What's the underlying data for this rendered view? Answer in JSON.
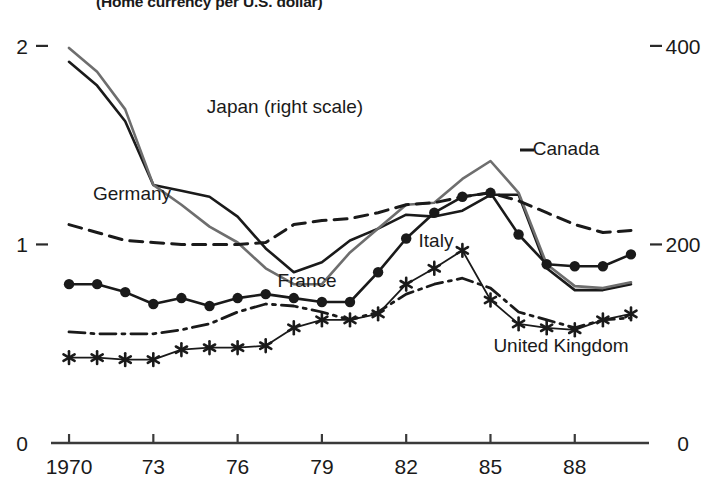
{
  "chart_data": {
    "type": "line",
    "title": "(Home currency per U.S. dollar)",
    "xlabel": "",
    "ylabel": "",
    "grid": false,
    "legend_position": "inline-annotations",
    "x": [
      1970,
      1971,
      1972,
      1973,
      1974,
      1975,
      1976,
      1977,
      1978,
      1979,
      1980,
      1981,
      1982,
      1983,
      1984,
      1985,
      1986,
      1987,
      1988,
      1989,
      1990
    ],
    "x_tick_labels": [
      "1970",
      "73",
      "76",
      "79",
      "82",
      "85",
      "88"
    ],
    "x_tick_values": [
      1970,
      1973,
      1976,
      1979,
      1982,
      1985,
      1988
    ],
    "xlim": [
      1969.5,
      1990.5
    ],
    "left_axis": {
      "label_low": "0",
      "label_mid": "1",
      "label_high": "2",
      "ticks": [
        0,
        1,
        2
      ],
      "ylim": [
        0,
        2.08
      ]
    },
    "right_axis": {
      "label_low": "0",
      "label_mid": "200",
      "label_high": "400",
      "ticks": [
        0,
        200,
        400
      ],
      "ylim": [
        0,
        416
      ],
      "note": "Japan uses right scale"
    },
    "series": [
      {
        "name": "Japan (right scale)",
        "label": "Japan (right scale)",
        "axis": "right",
        "style": "solid",
        "marker": "none",
        "color": "#1a1a1a",
        "width": 2.6,
        "values": [
          1.92,
          1.8,
          1.62,
          1.3,
          1.27,
          1.24,
          1.14,
          0.98,
          0.86,
          0.91,
          1.02,
          1.08,
          1.15,
          1.14,
          1.17,
          1.25,
          1.25,
          0.88,
          0.77,
          0.77,
          0.8
        ],
        "label_xy": [
          285,
          113
        ]
      },
      {
        "name": "Germany",
        "label": "Germany",
        "axis": "left",
        "style": "solid",
        "marker": "none",
        "color": "#6e6e6e",
        "width": 2.6,
        "values": [
          1.99,
          1.87,
          1.68,
          1.3,
          1.2,
          1.09,
          1.01,
          0.88,
          0.8,
          0.8,
          0.96,
          1.08,
          1.2,
          1.21,
          1.33,
          1.42,
          1.26,
          0.9,
          0.79,
          0.78,
          0.81
        ],
        "label_xy": [
          132,
          200
        ]
      },
      {
        "name": "Canada",
        "label": "Canada",
        "axis": "left",
        "style": "dashed",
        "marker": "none",
        "color": "#1a1a1a",
        "width": 3.0,
        "values": [
          1.1,
          1.06,
          1.02,
          1.01,
          1.0,
          1.0,
          1.0,
          1.01,
          1.1,
          1.12,
          1.13,
          1.16,
          1.2,
          1.21,
          1.24,
          1.26,
          1.22,
          1.16,
          1.1,
          1.06,
          1.07
        ],
        "label_xy": [
          566,
          155
        ]
      },
      {
        "name": "France",
        "label": "France",
        "axis": "left",
        "style": "solid",
        "marker": "circle",
        "color": "#1a1a1a",
        "width": 2.6,
        "values": [
          0.8,
          0.8,
          0.76,
          0.7,
          0.73,
          0.69,
          0.73,
          0.75,
          0.73,
          0.71,
          0.71,
          0.86,
          1.03,
          1.16,
          1.24,
          1.26,
          1.05,
          0.9,
          0.89,
          0.89,
          0.95
        ],
        "label_xy": [
          307,
          287
        ]
      },
      {
        "name": "Italy",
        "label": "Italy",
        "axis": "left",
        "style": "solid",
        "marker": "asterisk",
        "color": "#1a1a1a",
        "width": 1.8,
        "values": [
          0.43,
          0.43,
          0.42,
          0.42,
          0.47,
          0.48,
          0.48,
          0.49,
          0.58,
          0.62,
          0.62,
          0.65,
          0.8,
          0.88,
          0.97,
          0.72,
          0.6,
          0.58,
          0.57,
          0.62,
          0.65
        ],
        "label_xy": [
          436,
          247
        ]
      },
      {
        "name": "United Kingdom",
        "label": "United Kingdom",
        "axis": "left",
        "style": "dashdot",
        "marker": "none",
        "color": "#1a1a1a",
        "width": 2.8,
        "values": [
          0.56,
          0.55,
          0.55,
          0.55,
          0.57,
          0.6,
          0.66,
          0.7,
          0.69,
          0.66,
          0.62,
          0.66,
          0.75,
          0.8,
          0.83,
          0.78,
          0.66,
          0.62,
          0.58,
          0.62,
          0.63
        ],
        "label_xy": [
          561,
          352
        ]
      }
    ]
  },
  "geometry": {
    "plot_left": 55,
    "plot_right": 645,
    "y_zero": 443,
    "y_one": 238,
    "y_two": 30,
    "axis_label_left_x": 22,
    "axis_label_right_x": 683
  }
}
